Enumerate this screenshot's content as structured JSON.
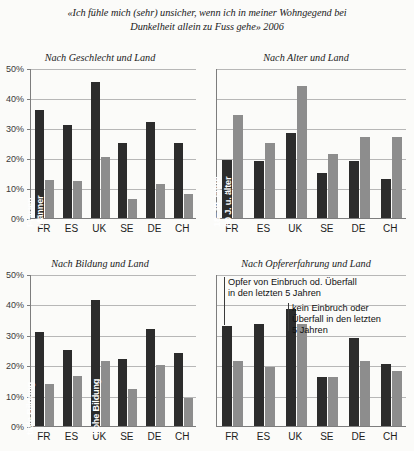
{
  "title": {
    "line1": "«Ich fühle mich (sehr) unsicher, wenn ich in meiner Wohngegend bei",
    "line2": "Dunkelheit allein zu Fuss gehe» 2006"
  },
  "colors": {
    "series_dark": "#2c2c2c",
    "series_light": "#8d8d8d",
    "gridline": "#b7b7b7",
    "axis": "#7d7d7d",
    "background": "#fbfbf9"
  },
  "axis": {
    "ticks": [
      "0%",
      "10%",
      "20%",
      "30%",
      "40%",
      "50%"
    ],
    "min": 0,
    "max": 50
  },
  "charts": [
    {
      "id": "geschlecht",
      "title": "Nach Geschlecht und Land",
      "show_y_labels": true,
      "categories": [
        "FR",
        "ES",
        "UK",
        "SE",
        "DE",
        "CH"
      ],
      "series": [
        {
          "name": "Frauen",
          "label": "Frauen",
          "values": [
            36,
            31,
            45.5,
            25,
            32,
            25
          ]
        },
        {
          "name": "Männer",
          "label": "Männer",
          "values": [
            12.7,
            12.5,
            20.2,
            6.5,
            11.5,
            8
          ]
        }
      ]
    },
    {
      "id": "alter",
      "title": "Nach Alter und Land",
      "show_y_labels": false,
      "categories": [
        "FR",
        "ES",
        "UK",
        "SE",
        "DE",
        "CH"
      ],
      "series": [
        {
          "name": "18-39 Jahre",
          "label": "18–39 Jahre",
          "values": [
            19.5,
            19,
            28.5,
            15,
            19,
            13
          ]
        },
        {
          "name": "60 J. u. älter",
          "label": "60 J. u. älter",
          "values": [
            34.5,
            25,
            44,
            21.5,
            27,
            27
          ]
        }
      ]
    },
    {
      "id": "bildung",
      "title": "Nach Bildung und Land",
      "show_y_labels": true,
      "categories": [
        "FR",
        "ES",
        "UK",
        "SE",
        "DE",
        "CH"
      ],
      "series": [
        {
          "name": "tiefe Bildung",
          "label": "tiefe Bildung",
          "values": [
            31,
            25,
            41.3,
            22.2,
            32,
            24
          ]
        },
        {
          "name": "hohe Bildung",
          "label": "hohe Bildung",
          "values": [
            13.8,
            16.3,
            21.5,
            12.2,
            20,
            9.2
          ]
        }
      ]
    },
    {
      "id": "opfererfahrung",
      "title": "Nach Opfererfahrung und Land",
      "show_y_labels": false,
      "categories": [
        "FR",
        "ES",
        "UK",
        "SE",
        "DE",
        "CH"
      ],
      "series": [
        {
          "name": "Opfer",
          "label": "",
          "values": [
            33,
            33.5,
            38.5,
            16,
            29,
            20.5
          ]
        },
        {
          "name": "kein Opfer",
          "label": "",
          "values": [
            21.5,
            19.5,
            33.5,
            16,
            21.5,
            18
          ]
        }
      ],
      "annotations": [
        {
          "id": "opfer",
          "text": "Opfer von Einbruch od. Überfall\nin den letzten 5 Jahren"
        },
        {
          "id": "kein-opfer",
          "text": "kein Einbruch oder\nÜberfall in den letzten\n5 Jahren"
        }
      ]
    }
  ]
}
